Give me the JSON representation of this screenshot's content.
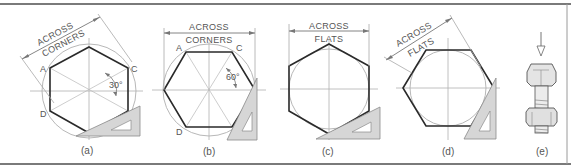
{
  "figure": {
    "colors": {
      "frame": "#7a7a7a",
      "hexagon": "#2a2a2a",
      "construction": "#b0b0b0",
      "triangle_fill": "#d6d6d6",
      "triangle_stroke": "#8a8a8a",
      "text": "#555555"
    },
    "panels": [
      {
        "id": "a",
        "caption": "(a)",
        "dimension_label_line1": "ACROSS",
        "dimension_label_line2": "CORNERS",
        "points": [
          "A",
          "B",
          "C",
          "D"
        ],
        "angle_label": "30°"
      },
      {
        "id": "b",
        "caption": "(b)",
        "dimension_label_line1": "ACROSS",
        "dimension_label_line2": "CORNERS",
        "points": [
          "A",
          "B",
          "C",
          "D"
        ],
        "angle_label": "60°"
      },
      {
        "id": "c",
        "caption": "(c)",
        "dimension_label_line1": "ACROSS",
        "dimension_label_line2": "FLATS"
      },
      {
        "id": "d",
        "caption": "(d)",
        "dimension_label_line1": "ACROSS",
        "dimension_label_line2": "FLATS"
      },
      {
        "id": "e",
        "caption": "(e)",
        "illustration": "hex-bolt-with-nut-icon"
      }
    ]
  }
}
